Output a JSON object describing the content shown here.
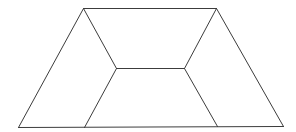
{
  "diagram": {
    "stroke_color": "#3c3c3c",
    "background": "#ffffff",
    "vertices": {
      "outer_top_left": [
        83,
        8
      ],
      "outer_top_right": [
        216,
        8
      ],
      "outer_bottom_right": [
        283,
        126
      ],
      "outer_bottom_left": [
        18,
        127
      ],
      "inner_left": [
        116,
        68
      ],
      "inner_right": [
        184,
        68
      ],
      "bottom_inner_left": [
        84,
        127
      ],
      "bottom_inner_right": [
        217,
        126
      ]
    },
    "edges": [
      {
        "name": "top-edge",
        "from": "outer_top_left",
        "to": "outer_top_right"
      },
      {
        "name": "right-edge",
        "from": "outer_top_right",
        "to": "outer_bottom_right"
      },
      {
        "name": "bottom-edge",
        "from": "outer_bottom_left",
        "to": "outer_bottom_right"
      },
      {
        "name": "left-edge",
        "from": "outer_top_left",
        "to": "outer_bottom_left"
      },
      {
        "name": "inner-top-left-diagonal",
        "from": "outer_top_left",
        "to": "inner_left"
      },
      {
        "name": "inner-top-right-diagonal",
        "from": "outer_top_right",
        "to": "inner_right"
      },
      {
        "name": "inner-horizontal-edge",
        "from": "inner_left",
        "to": "inner_right"
      },
      {
        "name": "inner-bottom-left-diagonal",
        "from": "inner_left",
        "to": "bottom_inner_left"
      },
      {
        "name": "inner-bottom-right-diagonal",
        "from": "inner_right",
        "to": "bottom_inner_right"
      }
    ]
  }
}
